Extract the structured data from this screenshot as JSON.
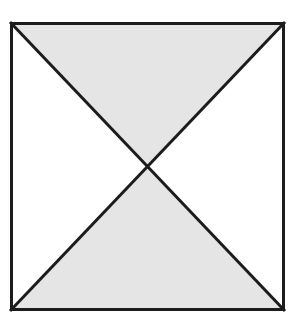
{
  "canvas": {
    "width": 299,
    "height": 331,
    "background_color": "#ffffff"
  },
  "top_rule": {
    "name": "horizontal-rule",
    "x": 0,
    "y": 4,
    "width": 299,
    "height": 2,
    "color": "#1c1c1c"
  },
  "figure": {
    "title": "",
    "square": {
      "left": 10,
      "top": 22,
      "right": 285,
      "bottom": 311,
      "stroke_color": "#1c1c1c",
      "stroke_width": 3,
      "fill_color": "#ffffff"
    },
    "center": {
      "x": 147.5,
      "y": 166.5
    },
    "vertices": {
      "top_left": [
        10,
        22
      ],
      "top_right": [
        285,
        22
      ],
      "bottom_right": [
        285,
        311
      ],
      "bottom_left": [
        10,
        311
      ]
    },
    "diagonals": [
      {
        "name": "diagonal-tl-br",
        "from": [
          10,
          22
        ],
        "to": [
          285,
          311
        ],
        "stroke_color": "#1c1c1c",
        "stroke_width": 3
      },
      {
        "name": "diagonal-tr-bl",
        "from": [
          285,
          22
        ],
        "to": [
          10,
          311
        ],
        "stroke_color": "#1c1c1c",
        "stroke_width": 3
      }
    ],
    "regions": [
      {
        "name": "top-triangle",
        "points": "10,22 285,22 147.5,166.5",
        "fill_color": "#e5e5e5",
        "shaded": "true"
      },
      {
        "name": "bottom-triangle",
        "points": "10,311 285,311 147.5,166.5",
        "fill_color": "#e5e5e5",
        "shaded": "true"
      },
      {
        "name": "left-triangle",
        "points": "10,22 10,311 147.5,166.5",
        "fill_color": "#ffffff",
        "shaded": "false"
      },
      {
        "name": "right-triangle",
        "points": "285,22 285,311 147.5,166.5",
        "fill_color": "#ffffff",
        "shaded": "false"
      }
    ]
  }
}
